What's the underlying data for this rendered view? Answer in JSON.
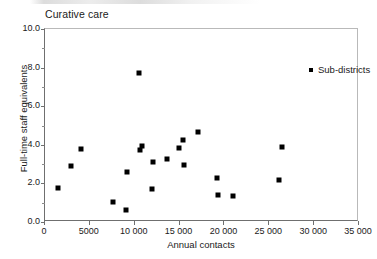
{
  "chart_data": {
    "type": "scatter",
    "title": "Curative care",
    "xlabel": "Annual contacts",
    "ylabel": "Full-time staff equivalents",
    "xlim": [
      0,
      35000
    ],
    "ylim": [
      0,
      10
    ],
    "grid": false,
    "legend_position": "top-right",
    "x_ticks": [
      0,
      5000,
      10000,
      15000,
      20000,
      25000,
      30000,
      35000
    ],
    "x_tick_labels": [
      "0",
      "5000",
      "10 000",
      "15 000",
      "20 000",
      "25 000",
      "30 000",
      "35 000"
    ],
    "y_ticks": [
      0.0,
      2.0,
      4.0,
      6.0,
      8.0,
      10.0
    ],
    "y_tick_labels": [
      "0.0",
      "2.0",
      "4.0",
      "6.0",
      "8.0",
      "10.0"
    ],
    "y_minor_ticks": [
      1.0,
      3.0,
      5.0,
      7.0,
      9.0
    ],
    "series": [
      {
        "name": "Sub-districts",
        "marker": "square",
        "color": "#000000",
        "points": [
          {
            "x": 1400,
            "y": 1.78
          },
          {
            "x": 2900,
            "y": 2.88
          },
          {
            "x": 4050,
            "y": 3.8
          },
          {
            "x": 7550,
            "y": 1.02
          },
          {
            "x": 9050,
            "y": 0.62
          },
          {
            "x": 9150,
            "y": 2.6
          },
          {
            "x": 10500,
            "y": 7.72
          },
          {
            "x": 10600,
            "y": 3.74
          },
          {
            "x": 10850,
            "y": 3.94
          },
          {
            "x": 11900,
            "y": 1.72
          },
          {
            "x": 12000,
            "y": 3.12
          },
          {
            "x": 13600,
            "y": 3.26
          },
          {
            "x": 14900,
            "y": 3.84
          },
          {
            "x": 15350,
            "y": 4.26
          },
          {
            "x": 15450,
            "y": 2.94
          },
          {
            "x": 17100,
            "y": 4.66
          },
          {
            "x": 19150,
            "y": 2.26
          },
          {
            "x": 19250,
            "y": 1.38
          },
          {
            "x": 21000,
            "y": 1.36
          },
          {
            "x": 26100,
            "y": 2.16
          },
          {
            "x": 26400,
            "y": 3.88
          }
        ]
      }
    ]
  },
  "legend": {
    "entries": [
      {
        "label": "Sub-districts"
      }
    ]
  }
}
